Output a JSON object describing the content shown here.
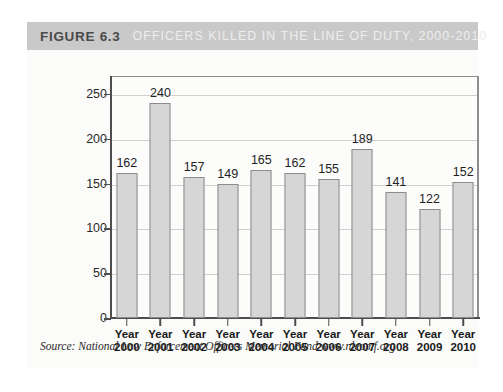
{
  "figure": {
    "number_label": "FIGURE 6.3",
    "caption": "OFFICERS KILLED IN THE LINE OF DUTY, 2000-2010",
    "header_bg": "#c9c9c9",
    "number_color": "#4a4a4a",
    "caption_color": "#ededed",
    "source": "Source: National Law Enforcement Officers Memorial Fund www.nleomf.org"
  },
  "chart_data": {
    "type": "bar",
    "title": "OFFICERS KILLED IN THE LINE OF DUTY, 2000-2010",
    "xlabel": "",
    "ylabel": "",
    "categories": [
      "Year 2000",
      "Year 2001",
      "Year 2002",
      "Year 2003",
      "Year 2004",
      "Year 2005",
      "Year 2006",
      "Year 2007",
      "Year 2008",
      "Year 2009",
      "Year 2010"
    ],
    "category_lines": [
      [
        "Year",
        "2000"
      ],
      [
        "Year",
        "2001"
      ],
      [
        "Year",
        "2002"
      ],
      [
        "Year",
        "2003"
      ],
      [
        "Year",
        "2004"
      ],
      [
        "Year",
        "2005"
      ],
      [
        "Year",
        "2006"
      ],
      [
        "Year",
        "2007"
      ],
      [
        "Year",
        "2008"
      ],
      [
        "Year",
        "2009"
      ],
      [
        "Year",
        "2010"
      ]
    ],
    "values": [
      162,
      240,
      157,
      149,
      165,
      162,
      155,
      189,
      141,
      122,
      152
    ],
    "data_labels": [
      "162",
      "240",
      "157",
      "149",
      "165",
      "162",
      "155",
      "189",
      "141",
      "122",
      "152"
    ],
    "ylim": [
      0,
      270
    ],
    "yticks": [
      0,
      50,
      100,
      150,
      200,
      250
    ],
    "ytick_labels": [
      "0",
      "50",
      "100",
      "150",
      "200",
      "250"
    ],
    "grid": true,
    "legend": false,
    "bar_color": "#d6d6d6",
    "bar_border_color": "#8c8c8c",
    "gridline_color": "#cfcfcf",
    "axis_color": "#4d4d4d"
  }
}
